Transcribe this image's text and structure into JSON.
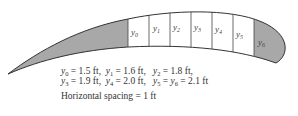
{
  "diagram": {
    "strips": [
      {
        "name": "y0",
        "var": "y",
        "sub": "0",
        "shaded": false
      },
      {
        "name": "y1",
        "var": "y",
        "sub": "1",
        "shaded": false
      },
      {
        "name": "y2",
        "var": "y",
        "sub": "2",
        "shaded": false
      },
      {
        "name": "y3",
        "var": "y",
        "sub": "3",
        "shaded": false
      },
      {
        "name": "y4",
        "var": "y",
        "sub": "4",
        "shaded": false
      },
      {
        "name": "y5",
        "var": "y",
        "sub": "5",
        "shaded": false
      },
      {
        "name": "y6",
        "var": "y",
        "sub": "6",
        "shaded": true
      }
    ],
    "colors": {
      "shade": "#a8a8a8",
      "outline": "#333333",
      "fill": "#ffffff"
    },
    "measurements": {
      "y0": "1.5 ft",
      "y1": "1.6 ft",
      "y2": "1.8 ft",
      "y3": "1.9 ft",
      "y4": "2.0 ft",
      "y5": "2.1 ft",
      "y6": "2.1 ft"
    },
    "line1": [
      {
        "v": "y",
        "s": "0",
        "t": " = 1.5 ft,  "
      },
      {
        "v": "y",
        "s": "1",
        "t": " = 1.6 ft,   "
      },
      {
        "v": "y",
        "s": "2",
        "t": " = 1.8 ft,"
      }
    ],
    "line2": [
      {
        "v": "y",
        "s": "3",
        "t": " = 1.9 ft,  "
      },
      {
        "v": "y",
        "s": "4",
        "t": " = 2.0 ft,   "
      },
      {
        "v": "y",
        "s": "5",
        "t": " = "
      },
      {
        "v": "y",
        "s": "6",
        "t": " = 2.1 ft"
      }
    ],
    "spacing_text": "Horizontal spacing = 1 ft"
  }
}
